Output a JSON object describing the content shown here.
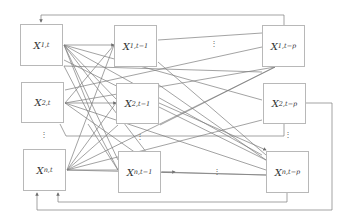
{
  "diagram": {
    "title": "",
    "nodes": [
      {
        "id": "x1t",
        "base": "X",
        "sub": "1,t",
        "x": 20,
        "y": 24,
        "w": 43,
        "h": 42
      },
      {
        "id": "x1t1",
        "base": "X",
        "sub": "1,t−1",
        "x": 114,
        "y": 25,
        "w": 43,
        "h": 42
      },
      {
        "id": "x1tp",
        "base": "X",
        "sub": "1,t−p",
        "x": 262,
        "y": 25,
        "w": 43,
        "h": 42
      },
      {
        "id": "x2t",
        "base": "X",
        "sub": "2,t",
        "x": 21,
        "y": 82,
        "w": 43,
        "h": 41
      },
      {
        "id": "x2t1",
        "base": "X",
        "sub": "2,t−1",
        "x": 116,
        "y": 83,
        "w": 43,
        "h": 41
      },
      {
        "id": "x2tp",
        "base": "X",
        "sub": "2,t−p",
        "x": 263,
        "y": 83,
        "w": 43,
        "h": 41
      },
      {
        "id": "xnt",
        "base": "X",
        "sub": "n,t",
        "x": 23,
        "y": 149,
        "w": 43,
        "h": 42
      },
      {
        "id": "xnt1",
        "base": "X",
        "sub": "n,t−1",
        "x": 118,
        "y": 151,
        "w": 43,
        "h": 42
      },
      {
        "id": "xntp",
        "base": "X",
        "sub": "n,t−p",
        "x": 266,
        "y": 151,
        "w": 43,
        "h": 42
      }
    ],
    "ellipses": [
      {
        "text": "⋮",
        "x": 210,
        "y": 40
      },
      {
        "text": "⋮",
        "x": 40,
        "y": 131
      },
      {
        "text": "⋮",
        "x": 284,
        "y": 131
      },
      {
        "text": "⋮",
        "x": 136,
        "y": 133
      },
      {
        "text": "⋮",
        "x": 213,
        "y": 168
      }
    ],
    "line_color": "#555555",
    "box_color": "#b8b8b8"
  }
}
